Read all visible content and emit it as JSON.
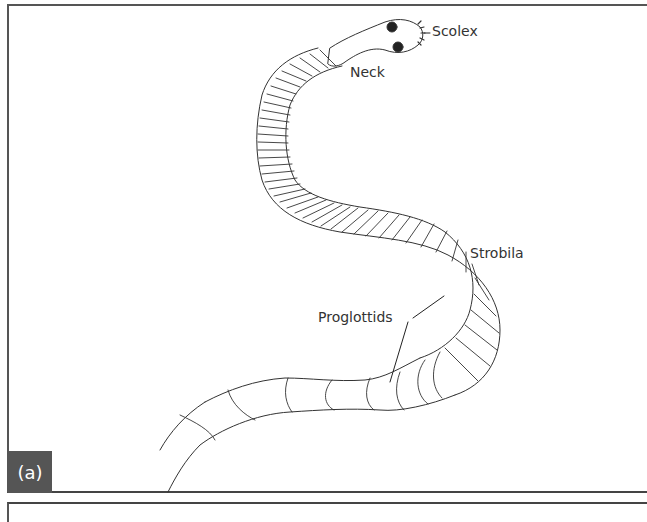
{
  "figure": {
    "panel_label": "(a)",
    "labels": {
      "scolex": "Scolex",
      "neck": "Neck",
      "strobila": "Strobila",
      "proglottids": "Proglottids"
    }
  },
  "colors": {
    "outline": "#333333",
    "frame": "#555555",
    "panel_label_bg": "#555555",
    "panel_label_text": "#ffffff"
  }
}
